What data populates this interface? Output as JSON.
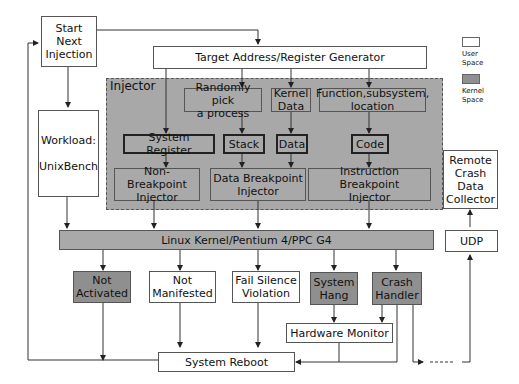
{
  "diagram": {
    "start": "Start\nNext\nInjection",
    "generator": "Target Address/Register Generator",
    "workload": "Workload:\n\nUnixBench",
    "injector_label": "Injector",
    "random_process": "Randomly pick\na process",
    "kernel_data": "Kernel\nData",
    "function": "Function,subsystem,\nlocation",
    "system_register": "System Register",
    "stack": "Stack",
    "data": "Data",
    "code": "Code",
    "non_bp_injector": "Non-Breakpoint\nInjector",
    "data_bp_injector": "Data Breakpoint\nInjector",
    "instr_bp_injector": "Instruction Breakpoint\nInjector",
    "kernel_bar": "Linux Kernel/Pentium 4/PPC G4",
    "remote": "Remote\nCrash\nData\nCollector",
    "udp": "UDP",
    "not_activated": "Not\nActivated",
    "not_manifested": "Not\nManifested",
    "fail_silence": "Fail Silence\nViolation",
    "system_hang": "System\nHang",
    "crash_handler": "Crash\nHandler",
    "hw_monitor": "Hardware Monitor",
    "reboot": "System Reboot"
  },
  "legend": {
    "user": "User\nSpace",
    "kernel": "Kernel\nSpace",
    "user_color": "#ffffff",
    "kernel_color": "#8f8f8f"
  }
}
